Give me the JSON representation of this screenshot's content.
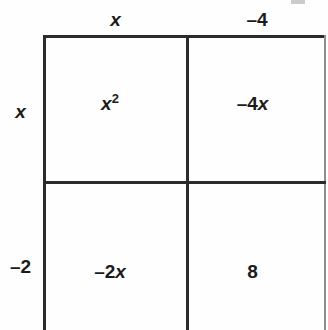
{
  "figure": {
    "type": "area-model-grid",
    "rows": 2,
    "columns": 2,
    "line_color": "#2b2b2b",
    "background_color": "#fefefe",
    "text_color": "#1b1b1b"
  },
  "column_headers": [
    {
      "label": "x",
      "style": "italic"
    },
    {
      "label": "–4",
      "style": "upright"
    }
  ],
  "row_headers": [
    {
      "label": "x",
      "style": "italic"
    },
    {
      "label": "–2",
      "style": "upright"
    }
  ],
  "cells": [
    {
      "row": 0,
      "column": 0,
      "text": "x²",
      "base": "x",
      "exponent": "2",
      "has_exponent": true,
      "sign": ""
    },
    {
      "row": 0,
      "column": 1,
      "text": "–4x",
      "coefficient": "–4",
      "variable": "x",
      "has_exponent": false,
      "sign": "–"
    },
    {
      "row": 1,
      "column": 0,
      "text": "–2x",
      "coefficient": "–2",
      "variable": "x",
      "has_exponent": false,
      "sign": "–"
    },
    {
      "row": 1,
      "column": 1,
      "text": "8",
      "coefficient": "8",
      "variable": "",
      "has_exponent": false,
      "sign": ""
    }
  ],
  "chart_data": {
    "type": "table",
    "title": "",
    "xlabel": "",
    "ylabel": "",
    "column_headers": [
      "x",
      "–4"
    ],
    "row_headers": [
      "x",
      "–2"
    ],
    "values": [
      [
        "x²",
        "–4x"
      ],
      [
        "–2x",
        "8"
      ]
    ],
    "grid": true,
    "legend": "none"
  }
}
